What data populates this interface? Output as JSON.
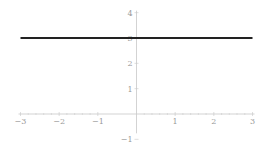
{
  "chart_data": {
    "type": "line",
    "title": "",
    "xlabel": "",
    "ylabel": "",
    "xlim": [
      -3,
      3
    ],
    "ylim": [
      -1,
      4
    ],
    "grid": false,
    "legend": null,
    "x_ticks": [
      "-3",
      "-2",
      "-1",
      "1",
      "2",
      "3"
    ],
    "y_ticks": [
      "-1",
      "1",
      "2",
      "3",
      "4"
    ],
    "series": [
      {
        "name": "y = 3",
        "x": [
          -3,
          3
        ],
        "y": [
          3,
          3
        ],
        "color": "#222222"
      }
    ]
  },
  "colors": {
    "axis": "#c8c8c8",
    "line": "#222222",
    "tick_label": "#9a9a9a"
  }
}
